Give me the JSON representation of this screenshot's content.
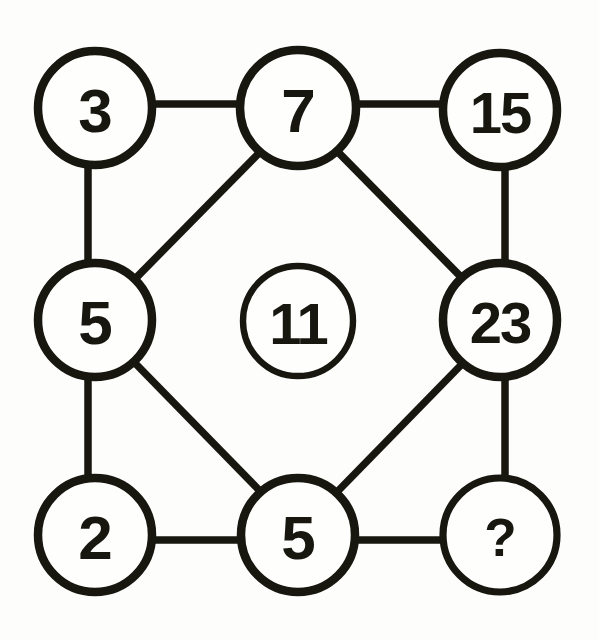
{
  "figure": {
    "kind": "number-circle-puzzle",
    "background_color": "#fdfdfc",
    "ink_color": "#17160f",
    "width": 599,
    "height": 640,
    "unknown_marker": "?"
  },
  "nodes": [
    {
      "id": "n-top-left",
      "label": "3",
      "cx": 95,
      "cy": 108,
      "r": 57,
      "style": "outer",
      "size": "single"
    },
    {
      "id": "n-top-center",
      "label": "7",
      "cx": 298,
      "cy": 108,
      "r": 58,
      "style": "outer",
      "size": "single"
    },
    {
      "id": "n-top-right",
      "label": "15",
      "cx": 500,
      "cy": 110,
      "r": 57,
      "style": "outer",
      "size": "pair"
    },
    {
      "id": "n-middle-left",
      "label": "5",
      "cx": 95,
      "cy": 320,
      "r": 57,
      "style": "outer",
      "size": "single"
    },
    {
      "id": "n-center",
      "label": "11",
      "cx": 298,
      "cy": 321,
      "r": 55,
      "style": "center",
      "size": "pair"
    },
    {
      "id": "n-middle-right",
      "label": "23",
      "cx": 500,
      "cy": 320,
      "r": 57,
      "style": "outer",
      "size": "pair"
    },
    {
      "id": "n-bottom-left",
      "label": "2",
      "cx": 95,
      "cy": 535,
      "r": 57,
      "style": "outer",
      "size": "single"
    },
    {
      "id": "n-bottom-center",
      "label": "5",
      "cx": 298,
      "cy": 535,
      "r": 57,
      "style": "outer",
      "size": "single"
    },
    {
      "id": "n-bottom-right",
      "label": "?",
      "cx": 500,
      "cy": 535,
      "r": 57,
      "style": "soft",
      "size": "small"
    }
  ],
  "edges": [
    {
      "id": "e-3-7",
      "from": "n-top-left",
      "to": "n-top-center",
      "x1": 150,
      "y1": 104,
      "x2": 243,
      "y2": 104,
      "kind": "horizontal"
    },
    {
      "id": "e-7-15",
      "from": "n-top-center",
      "to": "n-top-right",
      "x1": 354,
      "y1": 104,
      "x2": 445,
      "y2": 104,
      "kind": "horizontal"
    },
    {
      "id": "e-3-5",
      "from": "n-top-left",
      "to": "n-middle-left",
      "x1": 88,
      "y1": 163,
      "x2": 88,
      "y2": 266,
      "kind": "vertical"
    },
    {
      "id": "e-15-23",
      "from": "n-top-right",
      "to": "n-middle-right",
      "x1": 505,
      "y1": 165,
      "x2": 505,
      "y2": 266,
      "kind": "vertical"
    },
    {
      "id": "e-5-2",
      "from": "n-middle-left",
      "to": "n-bottom-left",
      "x1": 88,
      "y1": 375,
      "x2": 88,
      "y2": 480,
      "kind": "vertical"
    },
    {
      "id": "e-23-q",
      "from": "n-middle-right",
      "to": "n-bottom-right",
      "x1": 505,
      "y1": 375,
      "x2": 505,
      "y2": 480,
      "kind": "vertical"
    },
    {
      "id": "e-2-5b",
      "from": "n-bottom-left",
      "to": "n-bottom-center",
      "x1": 150,
      "y1": 540,
      "x2": 243,
      "y2": 540,
      "kind": "horizontal"
    },
    {
      "id": "e-5b-q",
      "from": "n-bottom-center",
      "to": "n-bottom-right",
      "x1": 354,
      "y1": 540,
      "x2": 445,
      "y2": 540,
      "kind": "horizontal"
    },
    {
      "id": "e-5l-7",
      "from": "n-middle-left",
      "to": "n-top-center",
      "x1": 132,
      "y1": 282,
      "x2": 262,
      "y2": 150,
      "kind": "diagonal"
    },
    {
      "id": "e-7-23",
      "from": "n-top-center",
      "to": "n-middle-right",
      "x1": 336,
      "y1": 150,
      "x2": 464,
      "y2": 280,
      "kind": "diagonal"
    },
    {
      "id": "e-5l-5b",
      "from": "n-middle-left",
      "to": "n-bottom-center",
      "x1": 132,
      "y1": 360,
      "x2": 261,
      "y2": 492,
      "kind": "diagonal"
    },
    {
      "id": "e-5b-23",
      "from": "n-bottom-center",
      "to": "n-middle-right",
      "x1": 337,
      "y1": 492,
      "x2": 464,
      "y2": 362,
      "kind": "diagonal"
    }
  ],
  "chart_data": {
    "type": "diagram",
    "title": "",
    "layout": "3x3 grid of circled numbers with a diamond of diagonal links",
    "grid": [
      [
        "3",
        "7",
        "15"
      ],
      [
        "5",
        "11",
        "23"
      ],
      [
        "2",
        "5",
        "?"
      ]
    ],
    "center_value": "11",
    "unknown_cell": {
      "row": 2,
      "col": 2,
      "label": "?"
    },
    "connections": [
      "3-7",
      "7-15",
      "3-5",
      "15-23",
      "5-2",
      "23-?",
      "2-5",
      "5-?",
      "5-7",
      "7-23",
      "5-5",
      "5-23"
    ],
    "isolated_nodes": [
      "11"
    ]
  }
}
